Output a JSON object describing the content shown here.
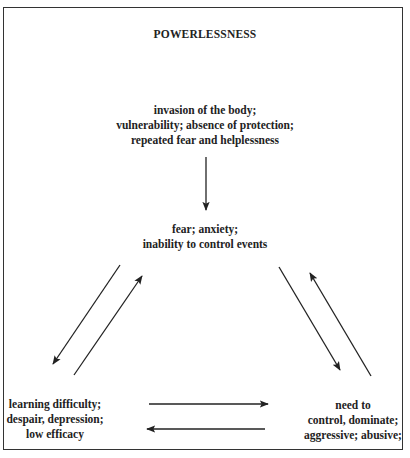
{
  "diagram": {
    "title": "POWERLESSNESS",
    "nodes": {
      "top": [
        "invasion of the body;",
        "vulnerability; absence of protection;",
        "repeated fear and helplessness"
      ],
      "middle": [
        "fear; anxiety;",
        "inability to control events"
      ],
      "left": [
        "learning difficulty;",
        "despair, depression;",
        "low efficacy"
      ],
      "right": [
        "need to",
        "control, dominate;",
        "aggressive; abusive;"
      ]
    },
    "edges": [
      {
        "from": "top",
        "to": "middle"
      },
      {
        "from": "middle",
        "to": "left"
      },
      {
        "from": "left",
        "to": "middle"
      },
      {
        "from": "middle",
        "to": "right"
      },
      {
        "from": "right",
        "to": "middle"
      },
      {
        "from": "left",
        "to": "right"
      },
      {
        "from": "right",
        "to": "left"
      }
    ],
    "colors": {
      "line": "#222222",
      "background": "#ffffff"
    }
  }
}
